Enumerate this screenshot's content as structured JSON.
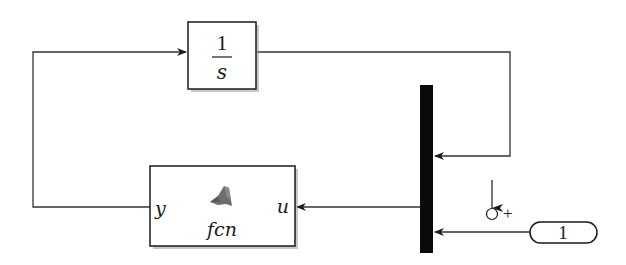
{
  "diagram": {
    "type": "simulink-block-diagram",
    "colors": {
      "background": "#ffffff",
      "line": "#333333",
      "block_border": "#1a1a1a",
      "mux_fill": "#0a0a0a",
      "shadow": "#9a9a9a",
      "matlab_icon": "#6e6e6e"
    },
    "blocks": {
      "integrator": {
        "numerator": "1",
        "denominator": "s"
      },
      "fcn": {
        "label": "fcn",
        "input_port": "u",
        "output_port": "y"
      },
      "mux": {
        "inputs": 2
      },
      "constant": {
        "value": "1"
      }
    },
    "annotations": {
      "sum_sign": "+"
    },
    "connections": [
      {
        "from": "fcn.y",
        "to": "integrator.in"
      },
      {
        "from": "integrator.out",
        "to": "mux.in1"
      },
      {
        "from": "constant.out",
        "to": "mux.in2"
      },
      {
        "from": "mux.out",
        "to": "fcn.u"
      }
    ]
  }
}
